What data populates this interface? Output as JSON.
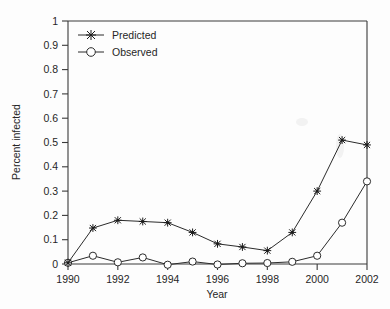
{
  "chart_data": {
    "type": "line",
    "title": "",
    "xlabel": "Year",
    "ylabel": "Percent infected",
    "x": [
      1990,
      1991,
      1992,
      1993,
      1994,
      1995,
      1996,
      1997,
      1998,
      1999,
      2000,
      2001,
      2002
    ],
    "xlim": [
      1990,
      2002
    ],
    "ylim": [
      0,
      1
    ],
    "xticks": [
      1990,
      1992,
      1994,
      1996,
      1998,
      2000,
      2002
    ],
    "xtick_labels": [
      "1990",
      "1992",
      "1994",
      "1996",
      "1998",
      "2000",
      "2002"
    ],
    "yticks": [
      0,
      0.1,
      0.2,
      0.3,
      0.4,
      0.5,
      0.6,
      0.7,
      0.8,
      0.9,
      1
    ],
    "ytick_labels": [
      "0",
      "0.1",
      "0.2",
      "0.3",
      "0.4",
      "0.5",
      "0.6",
      "0.7",
      "0.8",
      "0.9",
      "1"
    ],
    "grid": false,
    "legend_position": "upper-left",
    "series": [
      {
        "name": "Predicted",
        "marker": "star",
        "values": [
          0.005,
          0.148,
          0.18,
          0.175,
          0.17,
          0.13,
          0.083,
          0.07,
          0.055,
          0.13,
          0.3,
          0.51,
          0.49
        ]
      },
      {
        "name": "Observed",
        "marker": "circle",
        "values": [
          0.005,
          0.034,
          0.007,
          0.027,
          -0.003,
          0.01,
          -0.002,
          0.003,
          0.004,
          0.009,
          0.034,
          0.17,
          0.34
        ]
      }
    ]
  },
  "legend": {
    "items": [
      {
        "label": "Predicted"
      },
      {
        "label": "Observed"
      }
    ]
  },
  "axes": {
    "x_title": "Year",
    "y_title": "Percent infected"
  },
  "colors": {
    "line": "#2b2b2b",
    "axis": "#3a3a3a",
    "background": "#fdfdfd",
    "text": "#262626"
  }
}
